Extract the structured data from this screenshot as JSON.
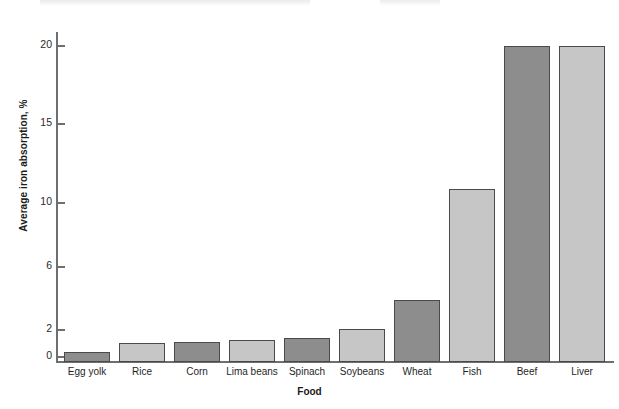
{
  "chart_data": {
    "type": "bar",
    "title": "",
    "xlabel": "Food",
    "ylabel": "Average iron absorption, %",
    "categories": [
      "Egg yolk",
      "Rice",
      "Corn",
      "Lima beans",
      "Spinach",
      "Soybeans",
      "Wheat",
      "Fish",
      "Beef",
      "Liver"
    ],
    "values": [
      0.6,
      1.2,
      1.25,
      1.4,
      1.5,
      2.1,
      4.0,
      11.1,
      20.2,
      20.2
    ],
    "bar_colors": [
      "#8d8d8d",
      "#c6c6c6",
      "#8d8d8d",
      "#c6c6c6",
      "#8d8d8d",
      "#c6c6c6",
      "#8d8d8d",
      "#c6c6c6",
      "#8d8d8d",
      "#c6c6c6"
    ],
    "bar_border_color": "#4a4a4a",
    "yticks": [
      0,
      2,
      6,
      10,
      15,
      20
    ],
    "ytick_labels": [
      "0",
      "2",
      "6",
      "10",
      "15",
      "20"
    ],
    "ylim": [
      0,
      21.5
    ],
    "grid": false,
    "legend": null,
    "axis_color": "#6e6e6e"
  },
  "axes": {
    "y_title": "Average iron absorption, %",
    "x_title": "Food"
  },
  "y_ticks": [
    {
      "label": "20",
      "top": 45
    },
    {
      "label": "15",
      "top": 123
    },
    {
      "label": "10",
      "top": 202
    },
    {
      "label": "6",
      "top": 266
    },
    {
      "label": "2",
      "top": 329
    },
    {
      "label": "0",
      "top": 356
    }
  ],
  "bars": [
    {
      "label": "Egg yolk",
      "value": 0.6,
      "left": 6,
      "width": 46,
      "height": 10,
      "shade": "medium"
    },
    {
      "label": "Rice",
      "value": 1.2,
      "left": 61,
      "width": 46,
      "height": 19,
      "shade": "light"
    },
    {
      "label": "Corn",
      "value": 1.25,
      "left": 116,
      "width": 46,
      "height": 20,
      "shade": "medium"
    },
    {
      "label": "Lima beans",
      "value": 1.4,
      "left": 171,
      "width": 46,
      "height": 22,
      "shade": "light"
    },
    {
      "label": "Spinach",
      "value": 1.5,
      "left": 226,
      "width": 46,
      "height": 24,
      "shade": "medium"
    },
    {
      "label": "Soybeans",
      "value": 2.1,
      "left": 281,
      "width": 46,
      "height": 33,
      "shade": "light"
    },
    {
      "label": "Wheat",
      "value": 4.0,
      "left": 336,
      "width": 46,
      "height": 62,
      "shade": "medium"
    },
    {
      "label": "Fish",
      "value": 11.1,
      "left": 391,
      "width": 46,
      "height": 173,
      "shade": "light"
    },
    {
      "label": "Beef",
      "value": 20.2,
      "left": 446,
      "width": 46,
      "height": 316,
      "shade": "medium"
    },
    {
      "label": "Liver",
      "value": 20.2,
      "left": 501,
      "width": 46,
      "height": 316,
      "shade": "light"
    }
  ]
}
